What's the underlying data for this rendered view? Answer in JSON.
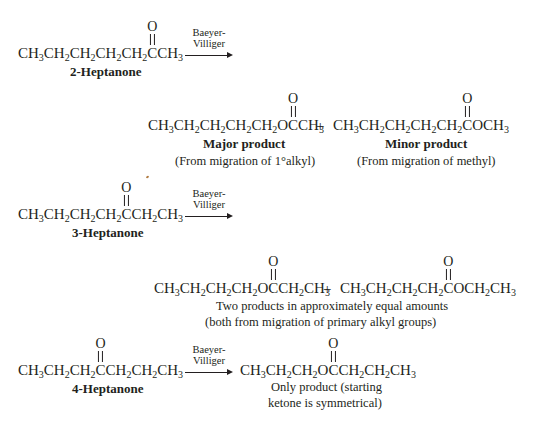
{
  "reactions": [
    {
      "reactant": {
        "pre": [
          "CH",
          "3",
          "CH",
          "2",
          "CH",
          "2",
          "CH",
          "2",
          "CH",
          "2"
        ],
        "carbonyl_atom": "C",
        "post": [
          "CH",
          "3"
        ],
        "name": "2-Heptanone"
      },
      "arrow": {
        "line1": "Baeyer-",
        "line2": "Villiger"
      },
      "products": [
        {
          "pre": [
            "CH",
            "3",
            "CH",
            "2",
            "CH",
            "2",
            "CH",
            "2",
            "CH",
            "2",
            "O"
          ],
          "carbonyl_atom": "C",
          "post": [
            "CH",
            "3"
          ],
          "label": "Major product",
          "caption": "(From migration of 1°alkyl)"
        },
        {
          "pre": [
            "CH",
            "3",
            "CH",
            "2",
            "CH",
            "2",
            "CH",
            "2",
            "CH",
            "2"
          ],
          "carbonyl_atom": "C",
          "post": [
            "OCH",
            "3"
          ],
          "label": "Minor product",
          "caption": "(From migration of methyl)"
        }
      ]
    },
    {
      "reactant": {
        "pre": [
          "CH",
          "3",
          "CH",
          "2",
          "CH",
          "2",
          "CH",
          "2"
        ],
        "carbonyl_atom": "C",
        "post": [
          "CH",
          "2",
          "CH",
          "3"
        ],
        "name": "3-Heptanone"
      },
      "arrow": {
        "line1": "Baeyer-",
        "line2": "Villiger"
      },
      "products": [
        {
          "pre": [
            "CH",
            "3",
            "CH",
            "2",
            "CH",
            "2",
            "CH",
            "2",
            "O"
          ],
          "carbonyl_atom": "C",
          "post": [
            "CH",
            "2",
            "CH",
            "3"
          ]
        },
        {
          "pre": [
            "CH",
            "3",
            "CH",
            "2",
            "CH",
            "2",
            "CH",
            "2"
          ],
          "carbonyl_atom": "C",
          "post": [
            "OCH",
            "2",
            "CH",
            "3"
          ]
        }
      ],
      "caption_line1": "Two products in approximately equal amounts",
      "caption_line2": "(both from migration of primary alkyl groups)"
    },
    {
      "reactant": {
        "pre": [
          "CH",
          "3",
          "CH",
          "2",
          "CH",
          "2"
        ],
        "carbonyl_atom": "C",
        "post": [
          "CH",
          "2",
          "CH",
          "2",
          "CH",
          "3"
        ],
        "name": "4-Heptanone"
      },
      "arrow": {
        "line1": "Baeyer-",
        "line2": "Villiger"
      },
      "products": [
        {
          "pre": [
            "CH",
            "3",
            "CH",
            "2",
            "CH",
            "2",
            "O"
          ],
          "carbonyl_atom": "C",
          "post": [
            "CH",
            "2",
            "CH",
            "2",
            "CH",
            "3"
          ]
        }
      ],
      "caption_line1": "Only product (starting",
      "caption_line2": "ketone is symmetrical)"
    }
  ],
  "symbols": {
    "oxygen": "O",
    "plus": "+"
  }
}
